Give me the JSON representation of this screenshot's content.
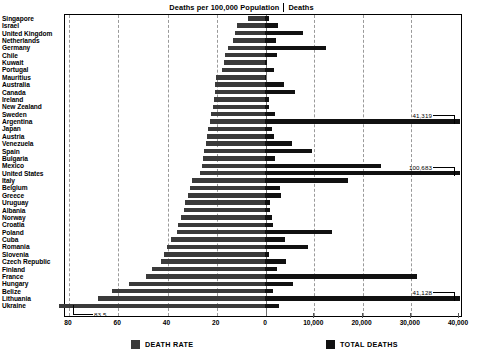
{
  "header": {
    "title_left": "Deaths per 100,000 Population",
    "title_right": "Deaths",
    "separator": "|"
  },
  "legend": {
    "items": [
      {
        "label": "DEATH RATE",
        "color": "#3a3a3a",
        "name": "death-rate"
      },
      {
        "label": "TOTAL DEATHS",
        "color": "#111111",
        "name": "total-deaths"
      }
    ]
  },
  "axes": {
    "left": {
      "name": "death-rate-axis",
      "ticks": [
        "80",
        "60",
        "40",
        "20",
        "0"
      ],
      "values": [
        80,
        60,
        40,
        20,
        0
      ],
      "max": 80,
      "min": 0
    },
    "right": {
      "name": "total-deaths-axis",
      "ticks": [
        "0",
        "10,000",
        "20,000",
        "30,000",
        "40,000"
      ],
      "values": [
        0,
        10000,
        20000,
        30000,
        40000
      ],
      "max": 40000,
      "min": 0
    }
  },
  "callouts": [
    {
      "label": "41,319",
      "country": "Argentina",
      "series": "total_deaths"
    },
    {
      "label": "100,683",
      "country": "United States",
      "series": "total_deaths"
    },
    {
      "label": "41,128",
      "country": "Lithuania",
      "series": "total_deaths"
    },
    {
      "label": "83.5",
      "country": "Ukraine",
      "series": "death_rate"
    }
  ],
  "chart_data": {
    "type": "bar",
    "orientation": "horizontal",
    "layout": "diverging-dual-axis",
    "xlabel": "",
    "ylabel": "",
    "grid": true,
    "legend_position": "bottom",
    "xlim_left": [
      0,
      80
    ],
    "xlim_right": [
      0,
      40000
    ],
    "categories": [
      "Singapore",
      "Israel",
      "United Kingdom",
      "Netherlands",
      "Germany",
      "Chile",
      "Kuwait",
      "Portugal",
      "Mauritius",
      "Australia",
      "Canada",
      "Ireland",
      "New Zealand",
      "Sweden",
      "Argentina",
      "Japan",
      "Austria",
      "Venezuela",
      "Spain",
      "Bulgaria",
      "Mexico",
      "United States",
      "Italy",
      "Belgium",
      "Greece",
      "Uruguay",
      "Albania",
      "Norway",
      "Croatia",
      "Poland",
      "Cuba",
      "Romania",
      "Slovenia",
      "Czech Republic",
      "Finland",
      "France",
      "Hungary",
      "Belize",
      "Lithuania",
      "Ukraine"
    ],
    "series": [
      {
        "name": "DEATH RATE",
        "axis": "left",
        "units": "deaths per 100,000 population",
        "color": "#3a3a3a",
        "values": [
          7.1,
          11.3,
          12.2,
          13.0,
          15.2,
          16.1,
          16.5,
          17.3,
          19.9,
          20.3,
          20.5,
          20.7,
          21.1,
          21.8,
          22.2,
          23.2,
          23.7,
          24.0,
          24.6,
          25.0,
          25.4,
          26.2,
          29.5,
          30.6,
          31.4,
          32.4,
          33.0,
          34.1,
          35.3,
          35.8,
          38.2,
          39.6,
          41.0,
          42.2,
          46.0,
          48.4,
          55.1,
          62.0,
          68.0,
          83.5
        ]
      },
      {
        "name": "TOTAL DEATHS",
        "axis": "right",
        "units": "deaths",
        "color": "#111111",
        "values": [
          900,
          2600,
          7800,
          2200,
          12600,
          2500,
          400,
          1800,
          250,
          3900,
          6300,
          800,
          800,
          2000,
          41319,
          1500,
          1900,
          5600,
          9700,
          2000,
          24000,
          100683,
          17100,
          3100,
          3300,
          1100,
          1000,
          1500,
          1600,
          13800,
          4200,
          9000,
          800,
          4400,
          2400,
          31500,
          5700,
          1600,
          41128,
          3000
        ]
      }
    ]
  }
}
